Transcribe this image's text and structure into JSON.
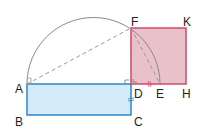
{
  "diagram": {
    "points": {
      "A": {
        "label": "A",
        "x": 27,
        "y": 84
      },
      "B": {
        "label": "B",
        "x": 27,
        "y": 115
      },
      "C": {
        "label": "C",
        "x": 131,
        "y": 115
      },
      "D": {
        "label": "D",
        "x": 131,
        "y": 84
      },
      "E": {
        "label": "E",
        "x": 160,
        "y": 84
      },
      "F": {
        "label": "F",
        "x": 131,
        "y": 28
      },
      "H": {
        "label": "H",
        "x": 186,
        "y": 84
      },
      "K": {
        "label": "K",
        "x": 186,
        "y": 28
      }
    },
    "colors": {
      "rectangle_fill": "#d4ecf9",
      "rectangle_stroke": "#2f86c8",
      "square_fill": "#e8c1cb",
      "square_stroke": "#d0486b",
      "arc_stroke": "#8a8a8a",
      "dashed_stroke": "#9a9a9a",
      "label": "#231f20"
    }
  }
}
